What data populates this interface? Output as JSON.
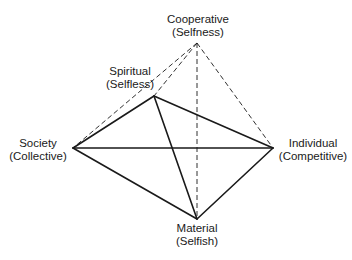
{
  "diagram": {
    "type": "pyramid-diagram",
    "nodes": {
      "cooperative": {
        "title": "Cooperative",
        "subtitle": "(Selfness)",
        "x": 197,
        "y": 43
      },
      "spiritual": {
        "title": "Spiritual",
        "subtitle": "(Selfless)",
        "x": 154,
        "y": 96
      },
      "society": {
        "title": "Society",
        "subtitle": "(Collective)",
        "x": 73,
        "y": 148
      },
      "individual": {
        "title": "Individual",
        "subtitle": "(Competitive)",
        "x": 273,
        "y": 148
      },
      "material": {
        "title": "Material",
        "subtitle": "(Selfish)",
        "x": 197,
        "y": 219
      }
    },
    "solid_edges": [
      [
        "society",
        "spiritual"
      ],
      [
        "spiritual",
        "individual"
      ],
      [
        "society",
        "individual"
      ],
      [
        "society",
        "material"
      ],
      [
        "individual",
        "material"
      ],
      [
        "spiritual",
        "material"
      ]
    ],
    "dashed_edges": [
      [
        "cooperative",
        "society"
      ],
      [
        "cooperative",
        "spiritual"
      ],
      [
        "cooperative",
        "individual"
      ],
      [
        "cooperative",
        "material"
      ]
    ],
    "colors": {
      "line": "#1a1a1a",
      "text": "#1a1a1a",
      "background": "#ffffff"
    }
  }
}
